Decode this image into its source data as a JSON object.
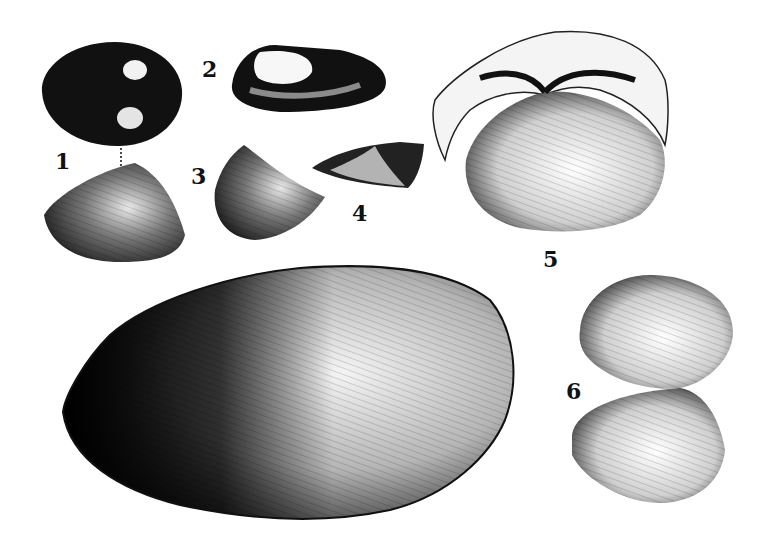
{
  "plate": {
    "background": "#ffffff",
    "ink": "#111111",
    "figures": [
      {
        "label": "1",
        "description": "bivalve shell, dorsal view (top) and side view (bottom)"
      },
      {
        "label": "2",
        "description": "elongate shell, oblique view"
      },
      {
        "label": "3",
        "description": "triangular shell, side view"
      },
      {
        "label": "4",
        "description": "wedge-shaped shell fragment"
      },
      {
        "label": "5",
        "description": "large clam with open hinge, umbo view"
      },
      {
        "label": "6",
        "description": "paired valves, top and bottom"
      },
      {
        "label": "",
        "description": "large mussel shell, unlabeled"
      }
    ]
  }
}
